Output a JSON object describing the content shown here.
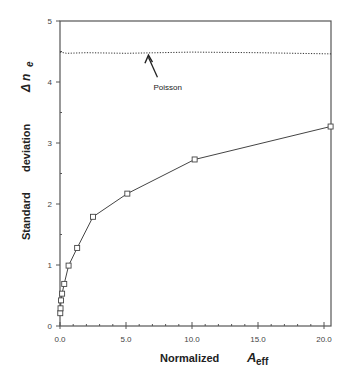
{
  "chart_data": {
    "type": "line",
    "title": "",
    "xlabel": "Normalized A_eff",
    "xlabel_parts": {
      "main": "Normalized",
      "symbol": "A",
      "subscript": "eff"
    },
    "ylabel": "Standard deviation Δn_e",
    "ylabel_parts": {
      "word1": "Standard",
      "word2": "deviation",
      "symbol": "Δ n",
      "subscript": "e"
    },
    "xlim": [
      0,
      20.6
    ],
    "ylim": [
      0,
      5
    ],
    "x_ticks": [
      "0.0",
      "5.0",
      "10.0",
      "15.0",
      "20.0"
    ],
    "x_tick_values": [
      0,
      5,
      10,
      15,
      20
    ],
    "x_minor_step": 1,
    "y_ticks": [
      "0",
      "1",
      "2",
      "3",
      "4",
      "5"
    ],
    "y_tick_values": [
      0,
      1,
      2,
      3,
      4,
      5
    ],
    "y_minor_step": 0.5,
    "grid": false,
    "series": [
      {
        "name": "Measured",
        "marker": "square",
        "line": "solid",
        "x": [
          0.02,
          0.04,
          0.08,
          0.16,
          0.32,
          0.65,
          1.3,
          2.5,
          5.1,
          10.2,
          20.5
        ],
        "y": [
          0.21,
          0.29,
          0.42,
          0.53,
          0.69,
          0.99,
          1.28,
          1.79,
          2.17,
          2.73,
          3.27
        ]
      },
      {
        "name": "Poisson",
        "marker": "none",
        "line": "dotted",
        "x": [
          0,
          0.5,
          2,
          5,
          10,
          15,
          20.6
        ],
        "y": [
          4.49,
          4.47,
          4.48,
          4.47,
          4.49,
          4.48,
          4.46
        ]
      }
    ],
    "annotations": [
      {
        "text": "Poisson",
        "arrow_to": [
          6.7,
          4.44
        ],
        "text_at": [
          7.5,
          3.9
        ]
      }
    ]
  }
}
